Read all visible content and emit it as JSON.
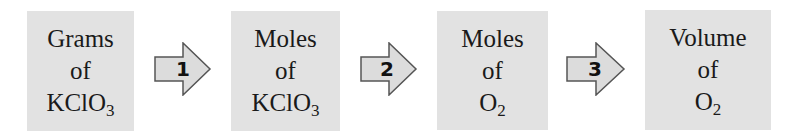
{
  "diagram": {
    "type": "flow",
    "colors": {
      "box_fill": "#e2e2e2",
      "arrow_fill": "#dcdcdc",
      "arrow_stroke": "#555555",
      "text": "#1a1a1a"
    },
    "boxes": [
      {
        "line1": "Grams",
        "line2": "of",
        "formula": "KClO",
        "subscript": "3"
      },
      {
        "line1": "Moles",
        "line2": "of",
        "formula": "KClO",
        "subscript": "3"
      },
      {
        "line1": "Moles",
        "line2": "of",
        "formula": "O",
        "subscript": "2"
      },
      {
        "line1": "Volume",
        "line2": "of",
        "formula": "O",
        "subscript": "2"
      }
    ],
    "arrows": [
      {
        "label": "1"
      },
      {
        "label": "2"
      },
      {
        "label": "3"
      }
    ]
  }
}
